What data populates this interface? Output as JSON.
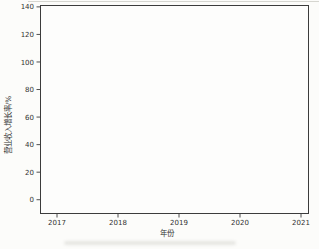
{
  "figure": {
    "background": "#fcfcfa",
    "plot_background": "#fdfdfc",
    "axis_color": "#3c3c3c",
    "text_color": "#323232"
  },
  "chart_data": {
    "type": "line",
    "title": "",
    "xlabel": "年份",
    "ylabel": "营业收入增长率/%",
    "x": [
      "2017",
      "2018",
      "2019",
      "2020",
      "2021"
    ],
    "series": [
      {
        "name": "营业收入增长率",
        "values": [
          133,
          -5,
          -5,
          26,
          2
        ],
        "color": "#969696"
      }
    ],
    "yticks": [
      0,
      20,
      40,
      60,
      80,
      100,
      120,
      140
    ],
    "ylim": [
      -10,
      141
    ],
    "grid": false,
    "legend": "none"
  }
}
